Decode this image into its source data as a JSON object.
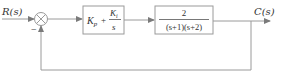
{
  "diagram": {
    "type": "closed-loop control block diagram",
    "input_label": "R(s)",
    "output_label": "C(s)",
    "summing_junction": {
      "symbol": "⊗",
      "feedback_sign": "−"
    },
    "blocks": [
      {
        "id": "pi-controller",
        "name": "PI controller",
        "term1_base": "K",
        "term1_sub": "p",
        "plus": "+",
        "frac_num_base": "K",
        "frac_num_sub": "i",
        "frac_den": "s"
      },
      {
        "id": "plant",
        "name": "Plant",
        "numerator": "2",
        "denominator": "(s+1)(s+2)"
      }
    ],
    "feedback": "unity negative feedback",
    "colors": {
      "line": "#9a9a9a",
      "text": "#333333",
      "background": "#ffffff"
    }
  }
}
